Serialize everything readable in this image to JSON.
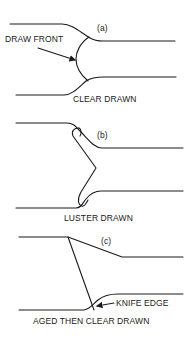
{
  "diagram": {
    "panels": [
      {
        "id": "a",
        "label": "(a)",
        "annotation": "DRAW FRONT",
        "caption": "CLEAR DRAWN"
      },
      {
        "id": "b",
        "label": "(b)",
        "caption": "LUSTER DRAWN"
      },
      {
        "id": "c",
        "label": "(c)",
        "annotation": "KNIFE EDGE",
        "caption": "AGED THEN CLEAR DRAWN"
      }
    ],
    "colors": {
      "ink": "#1a1a1a",
      "background": "#ffffff"
    }
  }
}
